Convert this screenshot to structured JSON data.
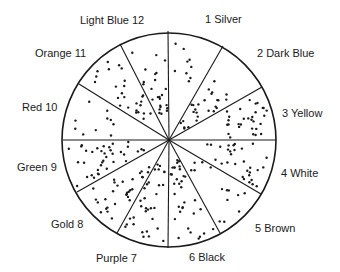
{
  "diagram": {
    "type": "sector-wheel",
    "center": [
      169,
      140
    ],
    "radius": 107,
    "stroke_color": "#1a1a1a",
    "dot_color": "#1a1a1a",
    "segments": [
      {
        "number": "1",
        "name": "Silver",
        "label": "1  Silver",
        "label_pos": [
          205,
          13
        ]
      },
      {
        "number": "2",
        "name": "Dark Blue",
        "label": "2  Dark Blue",
        "label_pos": [
          257,
          47
        ]
      },
      {
        "number": "3",
        "name": "Yellow",
        "label": "3  Yellow",
        "label_pos": [
          282,
          107
        ]
      },
      {
        "number": "4",
        "name": "White",
        "label": "4  White",
        "label_pos": [
          281,
          167
        ]
      },
      {
        "number": "5",
        "name": "Brown",
        "label": "5  Brown",
        "label_pos": [
          255,
          222
        ]
      },
      {
        "number": "6",
        "name": "Black",
        "label": "6  Black",
        "label_pos": [
          189,
          251
        ]
      },
      {
        "number": "7",
        "name": "Purple",
        "label": "Purple  7",
        "label_pos": [
          96,
          252
        ]
      },
      {
        "number": "8",
        "name": "Gold",
        "label": "Gold  8",
        "label_pos": [
          51,
          218
        ]
      },
      {
        "number": "9",
        "name": "Green",
        "label": "Green  9",
        "label_pos": [
          17,
          161
        ]
      },
      {
        "number": "10",
        "name": "Red",
        "label": "Red  10",
        "label_pos": [
          22,
          101
        ]
      },
      {
        "number": "11",
        "name": "Orange",
        "label": "Orange  11",
        "label_pos": [
          35,
          47
        ]
      },
      {
        "number": "12",
        "name": "Light Blue",
        "label": "Light Blue  12",
        "label_pos": [
          80,
          14
        ]
      }
    ],
    "dividers": [
      [
        168,
        31
      ],
      [
        223,
        46
      ],
      [
        262,
        87
      ],
      [
        276,
        140
      ],
      [
        261,
        194
      ],
      [
        220,
        233
      ],
      [
        168,
        248
      ],
      [
        117,
        233
      ],
      [
        77,
        192
      ],
      [
        63,
        140
      ],
      [
        79,
        84
      ],
      [
        120,
        44
      ]
    ]
  }
}
